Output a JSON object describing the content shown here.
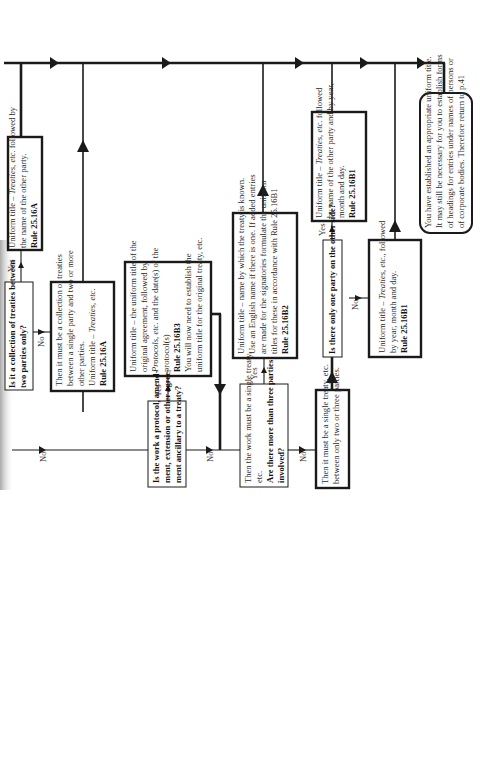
{
  "diagram": {
    "type": "flowchart",
    "orientation": "rotated-90-ccw",
    "labels": {
      "yes": "Yes",
      "no": "No"
    },
    "nodes": {
      "q_collection": {
        "kind": "question",
        "lines": [
          "Is it a collection of treaties between",
          "two parties only?"
        ],
        "bold": true
      },
      "a_two_parties": {
        "kind": "result",
        "lines": [
          "Uniform title – Treaties, etc. followed by",
          "the name of the other party."
        ],
        "rule": "Rule 25.16A"
      },
      "a_collection_multi": {
        "kind": "result",
        "lines": [
          "Then it must be a collection of treaties",
          "between a single party and two or more",
          "other parties.",
          "Uniform title – Treaties, etc."
        ],
        "rule": "Rule 25.16A"
      },
      "q_protocol": {
        "kind": "question",
        "lines": [
          "Is the work a protocol, amend-",
          "ment, extension or other agree-",
          "ment ancillary to a treaty?"
        ],
        "bold": true
      },
      "a_protocol": {
        "kind": "result",
        "lines": [
          "Uniform title – the uniform title of the",
          "original agreement, followed by",
          "Protocols, etc. and the date(s) of the",
          "protocol(s)"
        ],
        "rule": "Rule 25.16B3",
        "note_lines": [
          "You will now need to establish the",
          "uniform title for the original treaty, etc."
        ]
      },
      "q_more_than_three": {
        "kind": "question",
        "intro_lines": [
          "Then the work must be a single treaty,",
          "etc."
        ],
        "lines": [
          "Are there more than three parties",
          "involved?"
        ],
        "bold": true
      },
      "a_name_known": {
        "kind": "result",
        "lines": [
          "Uniform title – name by which the treaty is known.",
          "Use an English name if there is one. If added entries",
          "are made for the signatories formulate the uniform",
          "titles for these in accordance with Rule 25.16B1"
        ],
        "rule": "Rule 25.16B2"
      },
      "a_two_or_three": {
        "kind": "statement",
        "lines": [
          "Then it must be a single treaty, etc.",
          "between only two or three parties."
        ]
      },
      "q_one_party": {
        "kind": "question",
        "lines": [
          "Is there only one party on the other side?"
        ],
        "bold": true
      },
      "a_one_party_yes": {
        "kind": "result",
        "lines": [
          "Uniform title – Treaties, etc. followed",
          "by name of the other party and by year,",
          "month and day."
        ],
        "rule": "Rule 25.16B1"
      },
      "a_one_party_no": {
        "kind": "result",
        "lines": [
          "Uniform title – Treaties, etc., followed",
          "by year, month and day."
        ],
        "rule": "Rule 25.16B1"
      },
      "end": {
        "kind": "terminal",
        "lines": [
          "You have established an appropriate uniform title.",
          "It may still be necessary for you to establish forms",
          "of headings for entries under names of persons or",
          "of corporate bodies. Therefore return to p.41"
        ]
      }
    }
  }
}
